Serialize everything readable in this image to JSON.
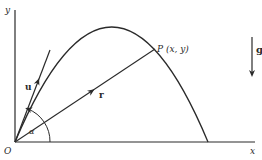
{
  "diagram": {
    "type": "projectile-motion",
    "colors": {
      "ink": "#2a2a2a",
      "background": "#ffffff"
    },
    "axes": {
      "x_label": "x",
      "y_label": "y",
      "origin_label": "O"
    },
    "point": {
      "label": "P (x, y)"
    },
    "vectors": {
      "initial_velocity": "u",
      "position": "r",
      "gravity": "g"
    },
    "angle": {
      "label": "α"
    }
  }
}
